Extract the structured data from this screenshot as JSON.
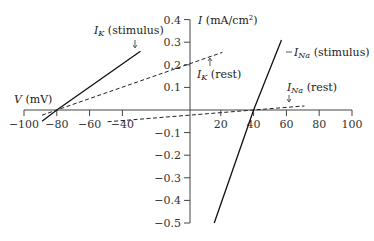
{
  "chart_data": {
    "type": "line",
    "title": "",
    "xlabel": "V (mV)",
    "ylabel": "I (mA/cm²)",
    "ylabel_parts": {
      "symbol": "I",
      "unit": " (mA/cm",
      "sup": "2",
      "close": ")"
    },
    "xlabel_parts": {
      "symbol": "V",
      "unit": " (mV)"
    },
    "xlim": [
      -100,
      100
    ],
    "ylim": [
      -0.5,
      0.4
    ],
    "grid": false,
    "x_ticks": [
      -100,
      -80,
      -60,
      -40,
      20,
      40,
      60,
      80,
      100
    ],
    "x_tick_labels": [
      "−100",
      "−80",
      "−60",
      "−40",
      "20",
      "40",
      "60",
      "80",
      "100"
    ],
    "y_ticks": [
      0.4,
      0.3,
      0.2,
      0.1,
      -0.1,
      -0.2,
      -0.3,
      -0.4,
      -0.5
    ],
    "y_tick_labels": [
      "0.4",
      "0.3",
      "0.2",
      "0.1",
      "−0.1",
      "−0.2",
      "−0.3",
      "−0.4",
      "−0.5"
    ],
    "series": [
      {
        "name": "I_K (stimulus)",
        "style": "solid",
        "x": [
          -89,
          -80,
          -29
        ],
        "y": [
          -0.05,
          0.0,
          0.26
        ],
        "label": {
          "sym": "I",
          "sub": "K",
          "text": " (stimulus)"
        }
      },
      {
        "name": "I_K (rest)",
        "style": "dashed",
        "x": [
          -89,
          -80,
          21
        ],
        "y": [
          -0.023,
          0.0,
          0.255
        ],
        "label": {
          "sym": "I",
          "sub": "K",
          "text": " (rest)"
        }
      },
      {
        "name": "I_Na (stimulus)",
        "style": "solid",
        "x": [
          16,
          40,
          57
        ],
        "y": [
          -0.5,
          0.0,
          0.31
        ],
        "label": {
          "sym": "I",
          "sub": "Na",
          "text": " (stimulus)"
        }
      },
      {
        "name": "I_Na (rest)",
        "style": "dashed",
        "x": [
          -49,
          40,
          71
        ],
        "y": [
          -0.052,
          0.0,
          0.018
        ],
        "label": {
          "sym": "I",
          "sub": "Na",
          "text": " (rest)"
        }
      }
    ],
    "annotations": [
      {
        "series": "I_K (stimulus)",
        "arrow": "down",
        "placement": "above line end"
      },
      {
        "series": "I_K (rest)",
        "arrow": "up",
        "placement": "below line end"
      },
      {
        "series": "I_Na (stimulus)",
        "arrow": "left",
        "placement": "right of line end"
      },
      {
        "series": "I_Na (rest)",
        "arrow": "down",
        "placement": "above line end"
      }
    ]
  }
}
